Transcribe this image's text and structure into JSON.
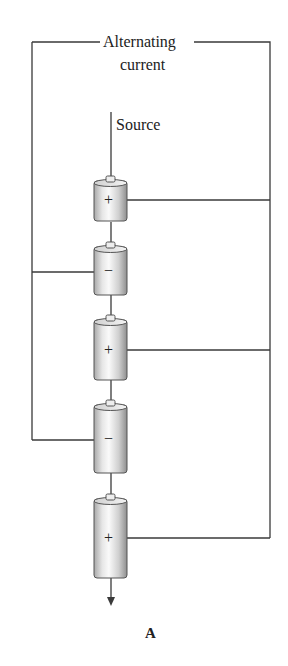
{
  "figure": {
    "title_line1": "Alternating",
    "title_line2": "current",
    "source_label": "Source",
    "panel_label": "A"
  },
  "colors": {
    "wire": "#3a3a3a",
    "cell_light": "#f2f2f2",
    "cell_dark": "#9a9a9a"
  },
  "cells": [
    {
      "sign": "+",
      "side": "right"
    },
    {
      "sign": "−",
      "side": "left"
    },
    {
      "sign": "+",
      "side": "right"
    },
    {
      "sign": "−",
      "side": "left"
    },
    {
      "sign": "+",
      "side": "right"
    }
  ]
}
